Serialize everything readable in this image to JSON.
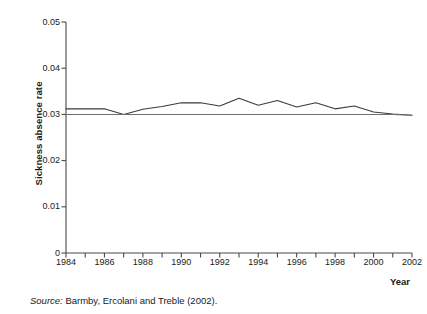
{
  "figure": {
    "source_note_prefix": "Source:",
    "source_note_text": " Barmby, Ercolani and Treble (2002)."
  },
  "axes": {
    "y_title": "Sickness absence rate",
    "x_title": "Year",
    "y_ticks": [
      "0",
      "0.01",
      "0.02",
      "0.03",
      "0.04",
      "0.05"
    ],
    "x_ticks": [
      "1984",
      "1986",
      "1988",
      "1990",
      "1992",
      "1994",
      "1996",
      "1998",
      "2000",
      "2002"
    ]
  },
  "chart_data": {
    "type": "line",
    "title": "",
    "xlabel": "Year",
    "ylabel": "Sickness absence rate",
    "xlim": [
      1984,
      2002
    ],
    "ylim": [
      0,
      0.05
    ],
    "yticks": [
      0,
      0.01,
      0.02,
      0.03,
      0.04,
      0.05
    ],
    "xticks": [
      1984,
      1986,
      1988,
      1990,
      1992,
      1994,
      1996,
      1998,
      2000,
      2002
    ],
    "grid": false,
    "legend": null,
    "x": [
      1984,
      1985,
      1986,
      1987,
      1988,
      1989,
      1990,
      1991,
      1992,
      1993,
      1994,
      1995,
      1996,
      1997,
      1998,
      1999,
      2000,
      2001,
      2002
    ],
    "series": [
      {
        "name": "Sickness absence rate",
        "color": "#3b3b3b",
        "values": [
          0.0312,
          0.0312,
          0.0312,
          0.03,
          0.0311,
          0.0317,
          0.0325,
          0.0325,
          0.0318,
          0.0335,
          0.032,
          0.033,
          0.0316,
          0.0325,
          0.0312,
          0.0318,
          0.0305,
          0.0301,
          0.0298
        ]
      },
      {
        "name": "Reference level",
        "color": "#6e6e6e",
        "values": [
          0.03,
          0.03,
          0.03,
          0.03,
          0.03,
          0.03,
          0.03,
          0.03,
          0.03,
          0.03,
          0.03,
          0.03,
          0.03,
          0.03,
          0.03,
          0.03,
          0.03,
          0.03,
          0.0298
        ]
      }
    ]
  },
  "colors": {
    "axis": "#4a4a4a",
    "line_primary": "#3b3b3b",
    "line_reference": "#6e6e6e",
    "text": "#1a1a1a",
    "background": "#ffffff"
  }
}
